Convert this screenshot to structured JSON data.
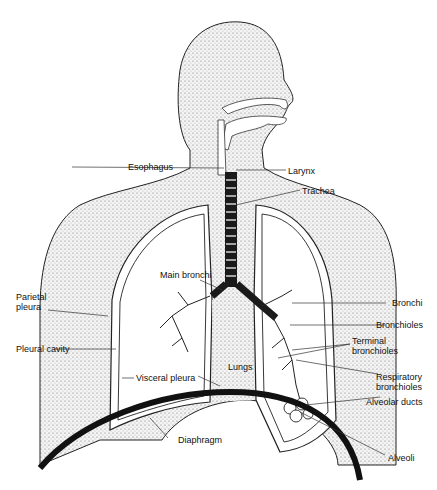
{
  "diagram": {
    "labels": {
      "esophagus": "Esophagus",
      "larynx": "Larynx",
      "trachea": "Trachea",
      "main_bronchi": "Main bronchi",
      "bronchi": "Bronchi",
      "bronchioles": "Bronchioles",
      "terminal_bronchioles_1": "Terminal",
      "terminal_bronchioles_2": "bronchioles",
      "respiratory_bronchioles_1": "Respiratory",
      "respiratory_bronchioles_2": "bronchioles",
      "alveolar_ducts": "Alveolar ducts",
      "alveoli": "Alveoli",
      "parietal_pleura_1": "Parietal",
      "parietal_pleura_2": "pleura",
      "pleural_cavity": "Pleural cavity",
      "visceral_pleura": "Visceral pleura",
      "lungs": "Lungs",
      "diaphragm": "Diaphragm"
    },
    "colors": {
      "ink": "#111111",
      "stipple": "#cfcfcf",
      "background": "#ffffff"
    }
  }
}
